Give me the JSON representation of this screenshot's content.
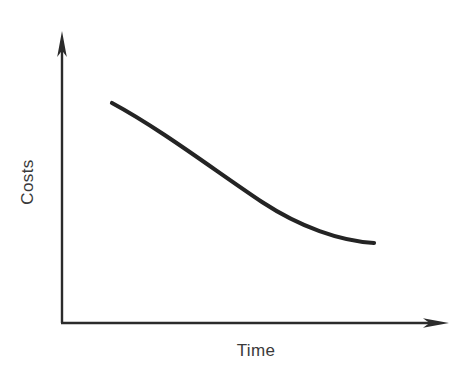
{
  "figure": {
    "background_color": "#ffffff",
    "ink_color": "#2b2b2b",
    "curve_color": "#242424",
    "text_color": "#3a3a3a",
    "width": 475,
    "height": 374
  },
  "axes": {
    "y_axis_label": "Costs",
    "x_axis_label": "Time",
    "origin": {
      "x": 62,
      "y": 323
    },
    "y_axis_top": {
      "x": 62,
      "y": 32
    },
    "x_axis_right": {
      "x": 448,
      "y": 323
    },
    "y_arrow_name": "y-axis-arrowhead",
    "x_arrow_name": "x-axis-arrowhead",
    "ticks": [],
    "gridlines": false
  },
  "chart_data": {
    "type": "line",
    "title": "",
    "subtitle": "",
    "xlabel": "Time",
    "ylabel": "Costs",
    "xlim": [
      0,
      1
    ],
    "ylim": [
      0,
      1
    ],
    "grid": false,
    "legend": null,
    "annotations": [],
    "axis_tick_labels": {
      "x": [],
      "y": []
    },
    "series": [
      {
        "name": "Costs over time",
        "color": "#242424",
        "line_width": 4.2,
        "x": [
          0.0,
          0.1,
          0.2,
          0.3,
          0.4,
          0.5,
          0.6,
          0.7,
          0.8,
          0.9,
          1.0
        ],
        "y": [
          1.0,
          0.907,
          0.818,
          0.735,
          0.657,
          0.585,
          0.52,
          0.46,
          0.405,
          0.353,
          0.305
        ],
        "pixel_points": [
          {
            "x": 112,
            "y": 103
          },
          {
            "x": 138,
            "y": 116
          },
          {
            "x": 164,
            "y": 129
          },
          {
            "x": 191,
            "y": 141
          },
          {
            "x": 217,
            "y": 152
          },
          {
            "x": 243,
            "y": 162
          },
          {
            "x": 269,
            "y": 171
          },
          {
            "x": 296,
            "y": 180
          },
          {
            "x": 322,
            "y": 188
          },
          {
            "x": 348,
            "y": 195
          },
          {
            "x": 374,
            "y": 243
          }
        ],
        "start_pixel": {
          "x": 112,
          "y": 103
        },
        "end_pixel": {
          "x": 374,
          "y": 243
        }
      }
    ]
  },
  "curve_path": "M 112 103 C 162 130, 214 170, 262 202 C 300 227, 340 241, 374 243"
}
